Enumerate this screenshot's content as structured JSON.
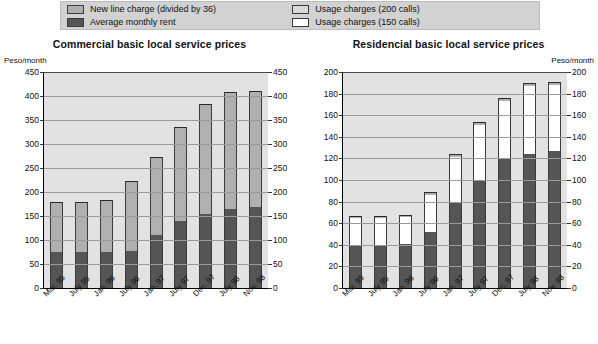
{
  "legend": {
    "items": [
      {
        "label": "New line charge (divided by 36)",
        "swatch": "light-gray-swatch",
        "color": "#b0b0b0"
      },
      {
        "label": "Average monthly rent",
        "swatch": "dark-gray-swatch",
        "color": "#555555"
      },
      {
        "label": "Usage charges (200 calls)",
        "swatch": "light-gray-outline-swatch",
        "color": "#d8d8d8"
      },
      {
        "label": "Usage charges (150 calls)",
        "swatch": "white-outline-swatch",
        "color": "#ffffff"
      }
    ]
  },
  "chart_data": [
    {
      "type": "bar",
      "id": "commercial",
      "title": "Commercial basic local service prices",
      "xlabel": "",
      "ylabel": "Peso/month",
      "ylim": [
        0,
        450
      ],
      "yticks": [
        0,
        50,
        100,
        150,
        200,
        250,
        300,
        350,
        400,
        450
      ],
      "ytick_labels": [
        "0",
        "50",
        "100",
        "150",
        "200",
        "250",
        "300",
        "350",
        "400",
        "450"
      ],
      "grid": true,
      "legend_position": "top",
      "stacked": true,
      "categories": [
        "Mar. 95",
        "July 95",
        "Jan. 96",
        "July 96",
        "Jan. 97",
        "July 97",
        "Dec. 97",
        "July 98",
        "Nov. 98"
      ],
      "series": [
        {
          "name": "Average monthly rent",
          "color": "#555555",
          "values": [
            75,
            75,
            76,
            78,
            110,
            140,
            155,
            165,
            168
          ]
        },
        {
          "name": "New line charge (divided by 36)",
          "color": "#b0b0b0",
          "values": [
            105,
            105,
            107,
            144,
            162,
            195,
            228,
            243,
            242
          ]
        }
      ],
      "totals": [
        180,
        180,
        183,
        222,
        272,
        335,
        383,
        408,
        410
      ]
    },
    {
      "type": "bar",
      "id": "residencial",
      "title": "Residencial basic local service prices",
      "xlabel": "",
      "ylabel": "Peso/month",
      "ylim": [
        0,
        200
      ],
      "yticks": [
        0,
        20,
        40,
        60,
        80,
        100,
        120,
        140,
        160,
        180,
        200
      ],
      "ytick_labels": [
        "0",
        "20",
        "40",
        "60",
        "80",
        "100",
        "120",
        "140",
        "160",
        "180",
        "200"
      ],
      "grid": true,
      "legend_position": "top",
      "stacked": true,
      "categories": [
        "Mar. 95",
        "July 95",
        "Jan. 96",
        "July 96",
        "Jan. 97",
        "July 97",
        "Dec. 97",
        "July 98",
        "Nov. 98"
      ],
      "series": [
        {
          "name": "Average monthly rent",
          "color": "#555555",
          "values": [
            40,
            40,
            41,
            52,
            80,
            100,
            119,
            124,
            127
          ]
        },
        {
          "name": "Usage charges (150 calls)",
          "color": "#ffffff",
          "values": [
            25,
            25,
            25,
            34,
            41,
            51,
            54,
            63,
            61
          ]
        },
        {
          "name": "New line charge (divided by 36)",
          "color": "#555555",
          "values": [
            2,
            2,
            2,
            3,
            3,
            3,
            3,
            3,
            3
          ]
        }
      ],
      "totals": [
        67,
        67,
        68,
        89,
        124,
        154,
        176,
        190,
        191
      ]
    }
  ]
}
